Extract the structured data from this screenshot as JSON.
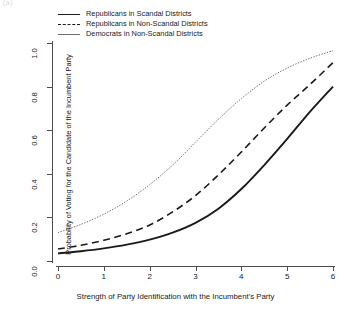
{
  "corner_label": "(a)",
  "chart_data": {
    "type": "line",
    "title": "",
    "xlabel": "Strength of Party Identification with the Incumbent's Party",
    "ylabel": "Probability of Voting for the Candidate of the Incumbent Party",
    "xlim": [
      0,
      6
    ],
    "ylim": [
      0,
      1
    ],
    "xticks": [
      0,
      1,
      2,
      3,
      4,
      5,
      6
    ],
    "xtick_labels": [
      "0",
      "1",
      "2",
      "3",
      "4",
      "5",
      "6"
    ],
    "yticks": [
      0.0,
      0.2,
      0.4,
      0.6,
      0.8,
      1.0
    ],
    "ytick_labels": [
      "0.0",
      "0.2",
      "0.4",
      "0.6",
      "0.8",
      "1.0"
    ],
    "grid": false,
    "legend_position": "top-left",
    "x": [
      0,
      0.5,
      1,
      1.5,
      2,
      2.5,
      3,
      3.5,
      4,
      4.5,
      5,
      5.5,
      6
    ],
    "series": [
      {
        "name": "Republicans in Scandal Districts",
        "style": "solid",
        "color": "#1a1a1a",
        "width": 1.9,
        "values": [
          0.035,
          0.045,
          0.058,
          0.075,
          0.098,
          0.13,
          0.175,
          0.24,
          0.33,
          0.44,
          0.56,
          0.685,
          0.8
        ]
      },
      {
        "name": "Republicans in Non-Scandal Districts",
        "style": "dashed",
        "color": "#1a1a1a",
        "width": 1.6,
        "values": [
          0.055,
          0.072,
          0.095,
          0.125,
          0.165,
          0.225,
          0.3,
          0.395,
          0.5,
          0.61,
          0.715,
          0.81,
          0.91
        ]
      },
      {
        "name": "Democrats in Non-Scandal Districts",
        "style": "dotted",
        "color": "#6f6f6f",
        "width": 1.0,
        "values": [
          0.13,
          0.168,
          0.215,
          0.275,
          0.35,
          0.44,
          0.545,
          0.65,
          0.745,
          0.825,
          0.885,
          0.93,
          0.965
        ]
      }
    ]
  }
}
